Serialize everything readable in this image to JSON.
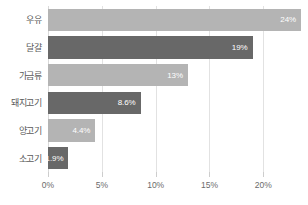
{
  "chart_data": {
    "type": "bar",
    "orientation": "horizontal",
    "title": "",
    "subtitle": "",
    "xlabel": "",
    "ylabel": "",
    "xlim": [
      0,
      23.5
    ],
    "grid": true,
    "legend": "none",
    "categories": [
      "우유",
      "달걀",
      "가금류",
      "돼지고기",
      "양고기",
      "소고기"
    ],
    "values": [
      24,
      19,
      13,
      8.6,
      4.4,
      1.9
    ],
    "value_labels": [
      "24%",
      "19%",
      "13%",
      "8.6%",
      "4.4%",
      "1.9%"
    ],
    "bar_colors": [
      "#b4b4b4",
      "#686868",
      "#b4b4b4",
      "#686868",
      "#b4b4b4",
      "#686868"
    ],
    "xticks": [
      0,
      5,
      10,
      15,
      20
    ],
    "xtick_labels": [
      "0%",
      "5%",
      "10%",
      "15%",
      "20%"
    ],
    "colors": {
      "light_bar": "#b4b4b4",
      "dark_bar": "#686868",
      "gridline": "#e2e2e2",
      "label_text": "#5a5a5a",
      "value_text": "#ffffff",
      "background": "#ffffff"
    }
  }
}
